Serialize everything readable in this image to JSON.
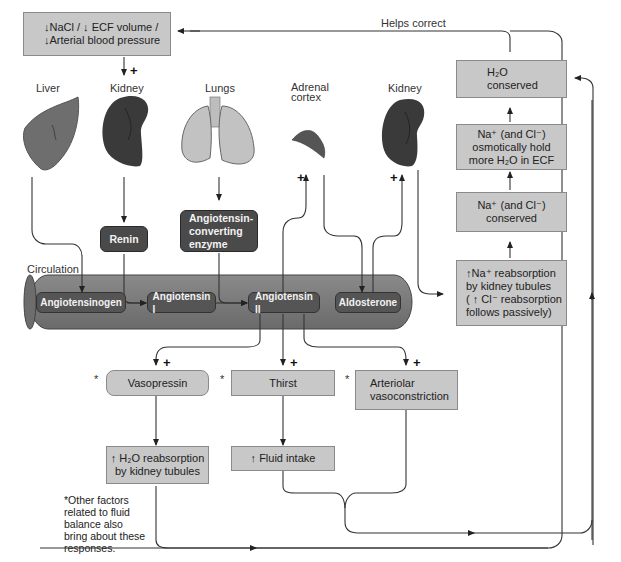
{
  "figure": {
    "stimulus_box": {
      "line1": "↓NaCl / ↓ ECF volume /",
      "line2": "↓Arterial blood pressure"
    },
    "helps_correct_label": "Helps correct",
    "organs": [
      {
        "id": "liver",
        "label": "Liver"
      },
      {
        "id": "kidney-1",
        "label": "Kidney"
      },
      {
        "id": "lungs",
        "label": "Lungs"
      },
      {
        "id": "adrenal-cortex",
        "label": "Adrenal\ncortex"
      },
      {
        "id": "kidney-2",
        "label": "Kidney"
      }
    ],
    "enzymes": {
      "renin": "Renin",
      "ace": "Angiotensin-\nconverting\nenzyme"
    },
    "circulation": {
      "label": "Circulation",
      "molecules": [
        "Angiotensinogen",
        "Angiotensin I",
        "Angiotensin II",
        "Aldosterone"
      ]
    },
    "right_chain": [
      {
        "id": "h2o-conserved",
        "text": "H₂O\nconserved"
      },
      {
        "id": "na-hold-water",
        "text": "Na⁺ (and Cl⁻)\nosmotically hold\nmore H₂O in ECF"
      },
      {
        "id": "na-conserved",
        "text": "Na⁺ (and Cl⁻)\nconserved"
      },
      {
        "id": "na-reabsorption",
        "text": "↑Na⁺ reabsorption\nby kidney tubules\n( ↑ Cl⁻ reabsorption\nfollows passively)"
      }
    ],
    "responses": [
      {
        "id": "vasopressin",
        "text": "Vasopressin"
      },
      {
        "id": "thirst",
        "text": "Thirst"
      },
      {
        "id": "arteriolar-vasoconstriction",
        "text": "Arteriolar\nvasoconstriction"
      }
    ],
    "outcomes": [
      {
        "id": "h2o-reabsorption",
        "text": "↑ H₂O reabsorption\nby kidney tubules"
      },
      {
        "id": "fluid-intake",
        "text": "↑ Fluid intake"
      }
    ],
    "stimulation_sign": "+",
    "asterisk": "*",
    "footnote": "*Other factors\nrelated to fluid\nbalance also\nbring about these\nresponses.",
    "colors": {
      "light_box": "#c8c8c8",
      "dark_box": "#4a4a4a",
      "tube": "#7a7a7a",
      "line": "#333333"
    }
  }
}
